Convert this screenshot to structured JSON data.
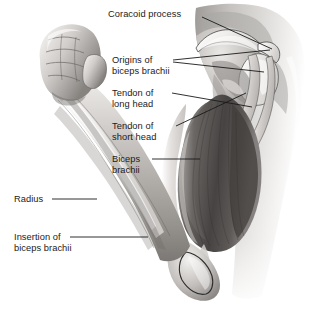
{
  "figure": {
    "background_color": "#ffffff",
    "label_text_color": "#1b1b1b",
    "leader_line_color": "#1a1a1a",
    "illustration_style": "grayscale medical airbrush illustration"
  },
  "labels": [
    {
      "id": "coracoid-process",
      "text": "Coracoid process",
      "lines": [
        "Coracoid process"
      ],
      "x": 108,
      "y": 9,
      "align": "left",
      "leaders": [
        [
          202,
          17,
          272,
          49
        ]
      ]
    },
    {
      "id": "origins-of-biceps-brachii",
      "text": "Origins of biceps brachii",
      "lines": [
        "Origins of",
        "biceps brachii"
      ],
      "x": 112,
      "y": 55,
      "align": "left",
      "leaders": [
        [
          173,
          60,
          270,
          50
        ],
        [
          173,
          62,
          264,
          72
        ]
      ]
    },
    {
      "id": "tendon-of-long-head",
      "text": "Tendon of long head",
      "lines": [
        "Tendon of",
        "long head"
      ],
      "x": 112,
      "y": 88,
      "align": "left",
      "leaders": [
        [
          172,
          93,
          252,
          107
        ]
      ]
    },
    {
      "id": "tendon-of-short-head",
      "text": "Tendon of short head",
      "lines": [
        "Tendon of",
        "short head"
      ],
      "x": 112,
      "y": 121,
      "align": "left",
      "leaders": [
        [
          176,
          126,
          246,
          93
        ]
      ]
    },
    {
      "id": "biceps-brachii",
      "text": "Biceps brachii",
      "lines": [
        "Biceps",
        "brachii"
      ],
      "x": 112,
      "y": 154,
      "align": "left",
      "leaders": [
        [
          152,
          159,
          200,
          159
        ]
      ]
    },
    {
      "id": "radius",
      "text": "Radius",
      "lines": [
        "Radius"
      ],
      "x": 14,
      "y": 194,
      "align": "left",
      "leaders": [
        [
          52,
          199,
          97,
          199
        ]
      ]
    },
    {
      "id": "insertion-of-biceps-brachii",
      "text": "Insertion of biceps brachii",
      "lines": [
        "Insertion of",
        "biceps brachii"
      ],
      "x": 14,
      "y": 232,
      "align": "left",
      "leaders": [
        [
          70,
          237,
          148,
          237
        ]
      ]
    }
  ],
  "anatomy": {
    "structures": [
      {
        "name": "fist",
        "description": "clenched right fist, knuckles and thumb visible"
      },
      {
        "name": "forearm",
        "description": "forearm flexed upward showing radius bone"
      },
      {
        "name": "radius",
        "description": "pale long bone running along the forearm"
      },
      {
        "name": "elbow",
        "description": "olecranon / elbow joint at lower right of arm"
      },
      {
        "name": "biceps-brachii-belly",
        "description": "dark striated two-headed muscle belly of the upper arm"
      },
      {
        "name": "long-head-tendon",
        "description": "tendon of long head passing over humeral head"
      },
      {
        "name": "short-head-tendon",
        "description": "tendon of short head attaching to coracoid process"
      },
      {
        "name": "coracoid-process",
        "description": "hook-shaped bony projection of the scapula"
      },
      {
        "name": "clavicle",
        "description": "collarbone arching over the shoulder joint"
      },
      {
        "name": "torso",
        "description": "shaded trunk and chest fading to white at the base"
      },
      {
        "name": "insertion",
        "description": "distal biceps tendon inserting on radial tuberosity"
      }
    ],
    "palette": {
      "skin_light": "#e8e6e4",
      "skin_mid": "#b9b6b3",
      "skin_shadow": "#7d7a78",
      "muscle_dark": "#4a4644",
      "muscle_mid": "#6e6a67",
      "bone_light": "#f1efed",
      "outline": "#3a3a3a"
    }
  }
}
